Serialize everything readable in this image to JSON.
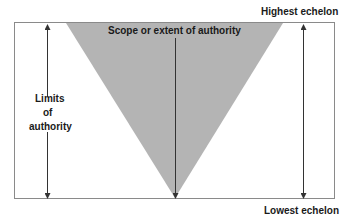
{
  "diagram": {
    "top_label": "Highest echelon",
    "bottom_label": "Lowest echelon",
    "center_label": "Scope or extent of authority",
    "left_label": [
      "Limits",
      "of",
      "authority"
    ],
    "colors": {
      "triangle": "#b4b4b4",
      "frame": "#8a8a8a",
      "arrow": "#333333"
    }
  }
}
